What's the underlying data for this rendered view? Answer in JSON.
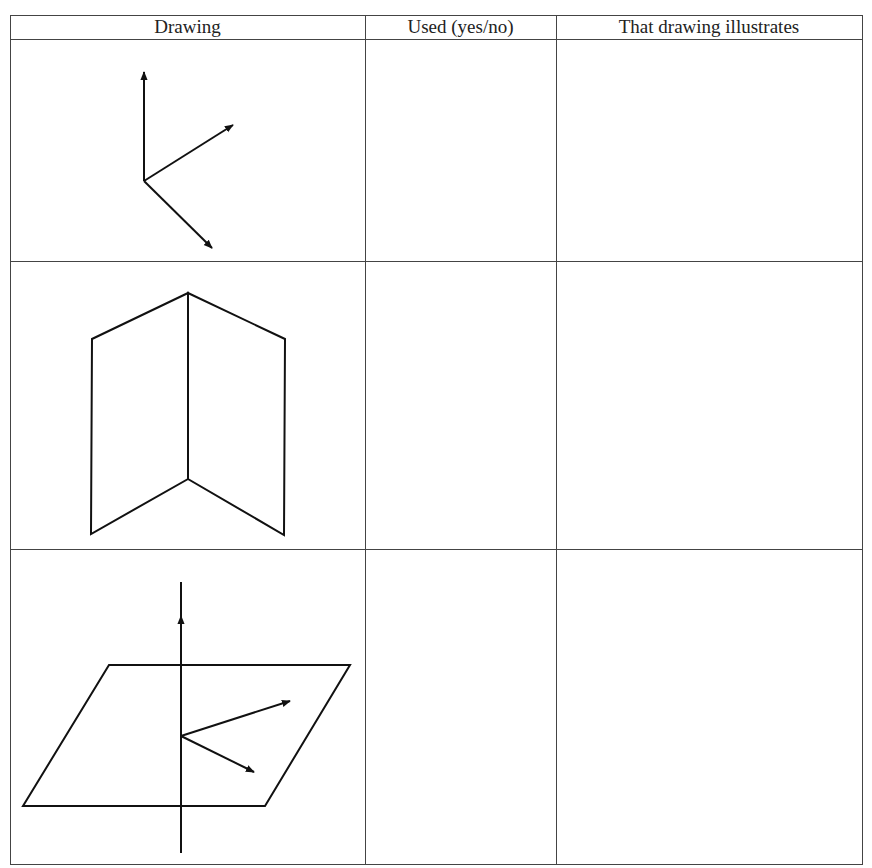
{
  "table": {
    "headers": [
      "Drawing",
      "Used (yes/no)",
      "That drawing illustrates"
    ],
    "rows": [
      {
        "drawing": "three-vectors-from-common-origin",
        "used": "",
        "illustrates": ""
      },
      {
        "drawing": "two-intersecting-half-planes",
        "used": "",
        "illustrates": ""
      },
      {
        "drawing": "line-perpendicular-to-plane-with-two-vectors",
        "used": "",
        "illustrates": ""
      }
    ]
  }
}
